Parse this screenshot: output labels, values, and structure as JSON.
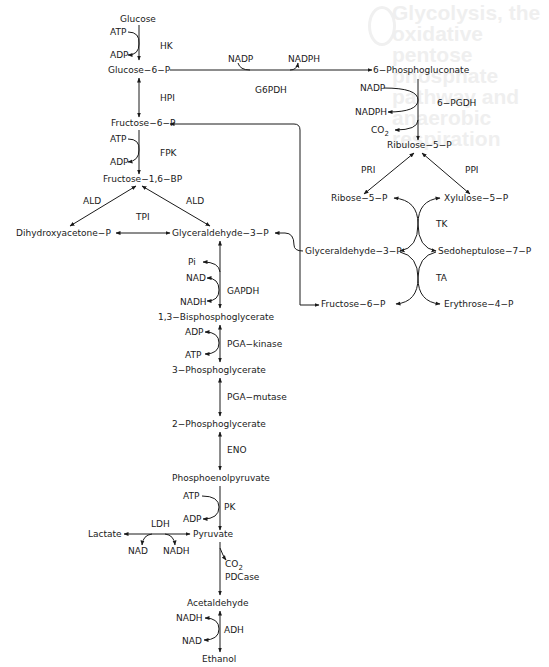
{
  "ghost_title": "Glycolysis, the oxidative pentose phosphate pathway and anaerobic respiration",
  "glycolysis": {
    "glucose": "Glucose",
    "hk": {
      "enzyme": "HK",
      "in": "ATP",
      "out": "ADP"
    },
    "g6p": "Glucose−6−P",
    "hpi": "HPI",
    "f6p": "Fructose−6−P",
    "fpk": {
      "enzyme": "FPK",
      "in": "ATP",
      "out": "ADP"
    },
    "f16bp": "Fructose−1,6−BP",
    "ald_left": "ALD",
    "ald_right": "ALD",
    "tpi": "TPI",
    "dhap": "Dihydroxyacetone−P",
    "g3p": "Glyceraldehyde−3−P",
    "gapdh": {
      "enzyme": "GAPDH",
      "pi": "Pi",
      "in": "NAD",
      "out": "NADH"
    },
    "bpg13": "1,3−Bisphosphoglycerate",
    "pgak": {
      "enzyme": "PGA−kinase",
      "in": "ADP",
      "out": "ATP"
    },
    "pg3": "3−Phosphoglycerate",
    "pgam": "PGA−mutase",
    "pg2": "2−Phosphoglycerate",
    "eno": "ENO",
    "pep": "Phosphoenolpyruvate",
    "pk": {
      "enzyme": "PK",
      "in": "ATP",
      "out": "ADP"
    },
    "pyruvate": "Pyruvate",
    "lactate": "Lactate",
    "ldh": {
      "enzyme": "LDH",
      "nad": "NAD",
      "nadh": "NADH"
    },
    "pdc": {
      "enzyme": "PDCase",
      "co2": "CO",
      "co2_sub": "2"
    },
    "acetaldehyde": "Acetaldehyde",
    "adh": {
      "enzyme": "ADH",
      "in": "NADH",
      "out": "NAD"
    },
    "ethanol": "Ethanol"
  },
  "pentose_phosphate": {
    "g6pdh": {
      "enzyme": "G6PDH",
      "in": "NADP",
      "out": "NADPH"
    },
    "pg6": "6−Phosphogluconate",
    "pgdh": {
      "enzyme": "6−PGDH",
      "in": "NADP",
      "out": "NADPH",
      "co2": "CO",
      "co2_sub": "2"
    },
    "ru5p": "Ribulose−5−P",
    "pri": "PRI",
    "ppi": "PPI",
    "r5p": "Ribose−5−P",
    "xu5p": "Xylulose−5−P",
    "tk": "TK",
    "g3p": "Glyceraldehyde−3−P",
    "s7p": "Sedoheptulose−7−P",
    "ta": "TA",
    "f6p": "Fructose−6−P",
    "e4p": "Erythrose−4−P"
  }
}
